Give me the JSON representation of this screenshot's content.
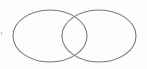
{
  "diagram": {
    "type": "venn",
    "sets": [
      {
        "id": "left",
        "label": "",
        "cx": 50,
        "cy": 36,
        "rx": 37,
        "ry": 26
      },
      {
        "id": "right",
        "label": "",
        "cx": 99,
        "cy": 36,
        "rx": 37,
        "ry": 26
      }
    ],
    "stroke_color": "#7a7a7a",
    "background_color": "#ffffff"
  }
}
